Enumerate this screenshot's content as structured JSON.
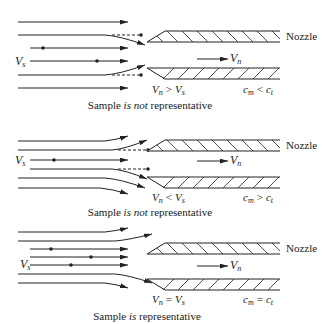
{
  "figure": {
    "panels": [
      {
        "id": "panel-1",
        "nozzle_label": "Nozzle",
        "free_stream_velocity": {
          "symbol": "V",
          "subscript": "s"
        },
        "nozzle_velocity": {
          "symbol": "V",
          "subscript": "n"
        },
        "velocity_relation": {
          "left": "V",
          "left_sub": "n",
          "op": ">",
          "right": "V",
          "right_sub": "s"
        },
        "concentration_relation": {
          "left": "c",
          "left_sub": "m",
          "op": "<",
          "right": "c",
          "right_sub": "t"
        },
        "caption": {
          "pre": "Sample ",
          "emph": "is not",
          "post": " representative"
        }
      },
      {
        "id": "panel-2",
        "nozzle_label": "Nozzle",
        "free_stream_velocity": {
          "symbol": "V",
          "subscript": "s"
        },
        "nozzle_velocity": {
          "symbol": "V",
          "subscript": "n"
        },
        "velocity_relation": {
          "left": "V",
          "left_sub": "n",
          "op": "<",
          "right": "V",
          "right_sub": "s"
        },
        "concentration_relation": {
          "left": "c",
          "left_sub": "m",
          "op": ">",
          "right": "c",
          "right_sub": "t"
        },
        "caption": {
          "pre": "Sample ",
          "emph": "is not",
          "post": " representative"
        }
      },
      {
        "id": "panel-3",
        "nozzle_label": "Nozzle",
        "free_stream_velocity": {
          "symbol": "V",
          "subscript": "s"
        },
        "nozzle_velocity": {
          "symbol": "V",
          "subscript": "n"
        },
        "velocity_relation": {
          "left": "V",
          "left_sub": "n",
          "op": "=",
          "right": "V",
          "right_sub": "s"
        },
        "concentration_relation": {
          "left": "c",
          "left_sub": "m",
          "op": "=",
          "right": "c",
          "right_sub": "t"
        },
        "caption": {
          "pre": "Sample ",
          "emph": "is",
          "post": " representative"
        }
      }
    ]
  }
}
